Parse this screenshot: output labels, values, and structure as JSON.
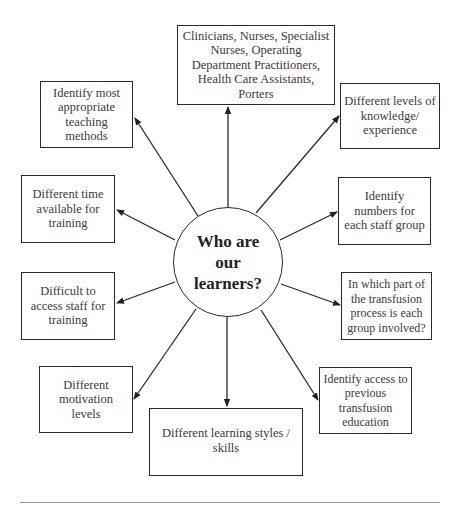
{
  "diagram": {
    "center": {
      "label": "Who are our learners?"
    },
    "nodes": [
      {
        "id": "staff-groups",
        "label": "Clinicians, Nurses, Specialist Nurses, Operating Department Practitioners, Health Care Assistants, Porters"
      },
      {
        "id": "teaching-methods",
        "label": "Identify most appropriate teaching methods"
      },
      {
        "id": "knowledge-levels",
        "label": "Different levels of knowledge/ experience"
      },
      {
        "id": "time-available",
        "label": "Different time available for training"
      },
      {
        "id": "staff-numbers",
        "label": "Identify numbers for each staff group"
      },
      {
        "id": "access-staff",
        "label": "Difficult to access staff for training"
      },
      {
        "id": "transfusion-process",
        "label": "In which part of the transfusion process is each group involved?"
      },
      {
        "id": "motivation",
        "label": "Different motivation levels"
      },
      {
        "id": "learning-styles",
        "label": "Different learning styles / skills"
      },
      {
        "id": "previous-education",
        "label": "Identify access to previous transfusion education"
      }
    ],
    "edges": [
      {
        "from": "center",
        "to": "staff-groups"
      },
      {
        "from": "center",
        "to": "teaching-methods"
      },
      {
        "from": "center",
        "to": "knowledge-levels"
      },
      {
        "from": "center",
        "to": "time-available"
      },
      {
        "from": "center",
        "to": "staff-numbers"
      },
      {
        "from": "center",
        "to": "access-staff"
      },
      {
        "from": "center",
        "to": "transfusion-process"
      },
      {
        "from": "center",
        "to": "motivation"
      },
      {
        "from": "center",
        "to": "learning-styles"
      },
      {
        "from": "center",
        "to": "previous-education"
      }
    ],
    "colors": {
      "line": "#2a2a2a",
      "text": "#3a3a3a",
      "rule": "#999999"
    }
  }
}
